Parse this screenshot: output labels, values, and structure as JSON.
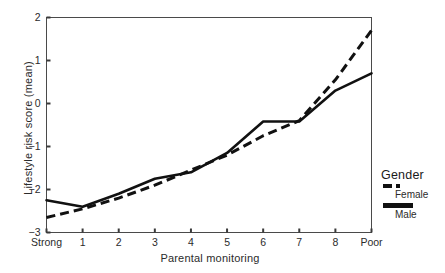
{
  "chart_data": {
    "type": "line",
    "title": "",
    "xlabel": "Parental monitoring",
    "ylabel": "Lifestyle risk score (mean)",
    "categories": [
      "Strong",
      "1",
      "2",
      "3",
      "4",
      "5",
      "6",
      "7",
      "8",
      "Poor"
    ],
    "x_tick_labels": [
      "Strong",
      "1",
      "2",
      "3",
      "4",
      "5",
      "6",
      "7",
      "8",
      "Poor"
    ],
    "y_tick_labels": [
      "2",
      "1",
      "0",
      "-1",
      "-2",
      "-3"
    ],
    "y_ticks": [
      2,
      1,
      0,
      -1,
      -2,
      -3
    ],
    "ylim": [
      -3,
      2
    ],
    "xlim": [
      0,
      9
    ],
    "grid": false,
    "frame": true,
    "legend_position": "right",
    "legend_title": "Gender",
    "series": [
      {
        "name": "Female",
        "style": "dashed",
        "color": "#111111",
        "values": [
          -2.65,
          -2.45,
          -2.2,
          -1.9,
          -1.55,
          -1.2,
          -0.75,
          -0.4,
          0.55,
          1.7
        ]
      },
      {
        "name": "Male",
        "style": "solid",
        "color": "#111111",
        "values": [
          -2.25,
          -2.4,
          -2.1,
          -1.75,
          -1.6,
          -1.15,
          -0.42,
          -0.42,
          0.3,
          0.7
        ]
      }
    ]
  },
  "legend": {
    "title": "Gender",
    "entries": [
      {
        "label": "Female",
        "style": "dashed"
      },
      {
        "label": "Male",
        "style": "solid"
      }
    ]
  }
}
